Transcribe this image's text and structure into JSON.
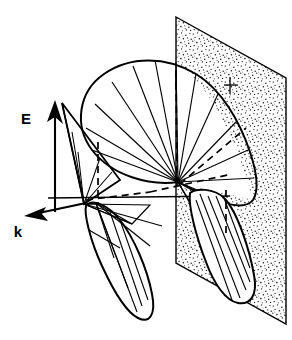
{
  "figure": {
    "type": "scientific-diagram",
    "background_color": "#ffffff",
    "ink_color": "#000000",
    "width": 292,
    "height": 340
  },
  "axes": {
    "e_vector": {
      "label": "E",
      "description": "Electric field vector arrow pointing up",
      "label_x": 26,
      "label_y": 118,
      "tail_x": 55,
      "tail_y": 212,
      "head_x": 55,
      "head_y": 104
    },
    "k_vector": {
      "label": "k",
      "description": "Wave vector arrow pointing down-left",
      "label_x": 14,
      "label_y": 232,
      "tail_x": 84,
      "tail_y": 204,
      "head_x": 24,
      "head_y": 216
    }
  },
  "plane": {
    "name": "stippled-plane",
    "description": "Stippled (dotted texture) parallelogram representing a surface",
    "fill_pattern": "stipple-dots",
    "dot_color": "#000000",
    "outline_color": "#000000",
    "corners": [
      {
        "x": 176,
        "y": 17
      },
      {
        "x": 286,
        "y": 78
      },
      {
        "x": 286,
        "y": 324
      },
      {
        "x": 176,
        "y": 263
      }
    ]
  },
  "lobes": [
    {
      "name": "main-upper-lobe",
      "description": "Large upper radiation lobe with radiating spoke lines",
      "origin_x": 178,
      "origin_y": 182
    },
    {
      "name": "lower-lobe",
      "description": "Elongated lower radiation lobe with spoke lines",
      "origin_x": 95,
      "origin_y": 203
    },
    {
      "name": "left-small-lobe",
      "description": "Small left lobe near the E vector arrow",
      "origin_x": 85,
      "origin_y": 205
    },
    {
      "name": "right-lobe-in-plane",
      "description": "Elongated white lobe overlapping the stippled plane",
      "origin_x": 225,
      "origin_y": 196
    }
  ],
  "construction_lines": {
    "dashed_description": "Hidden construction edges drawn dashed",
    "solid_description": "Visible radiating spoke lines drawn solid"
  }
}
